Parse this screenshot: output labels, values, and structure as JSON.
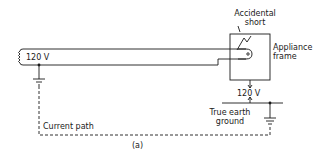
{
  "diagram": {
    "source_voltage_label": "120 V",
    "accidental_short_label": [
      "Accidental",
      "short"
    ],
    "appliance_frame_label": [
      "Appliance",
      "frame"
    ],
    "frame_voltage_label": "120 V",
    "true_earth_ground_label": [
      "True earth",
      "ground"
    ],
    "current_path_label": "Current path",
    "caption": "(a)"
  },
  "colors": {
    "line": "#1a1a1a",
    "background": "#ffffff"
  }
}
